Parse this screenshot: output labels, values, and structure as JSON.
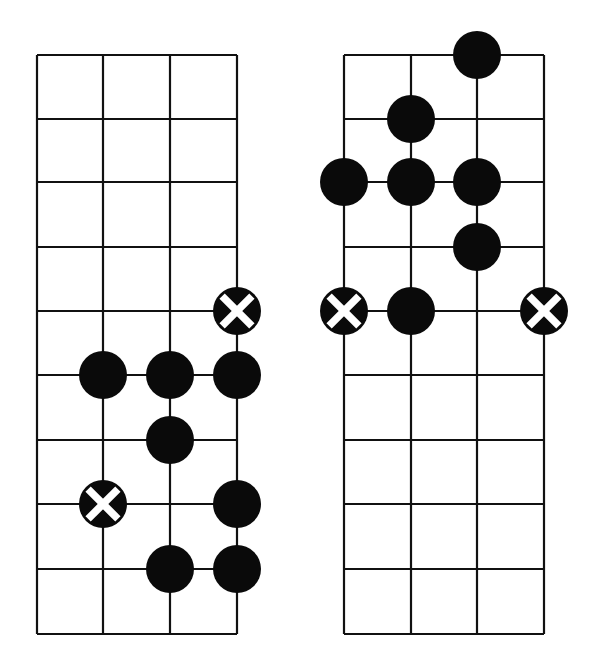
{
  "diagram": {
    "type": "fretboard-scale-patterns",
    "line_color": "#111111",
    "dot_color": "#0a0a0a",
    "x_color": "#ffffff",
    "background": "#ffffff",
    "dot_radius": 24,
    "row_lines_y": [
      55,
      119,
      182,
      247,
      311,
      375,
      440,
      504,
      569,
      634
    ],
    "grids": [
      {
        "id": "left",
        "columns_x": [
          37,
          103,
          170,
          237
        ],
        "markers": [
          {
            "col": 3,
            "row": 4,
            "kind": "root-x"
          },
          {
            "col": 1,
            "row": 5,
            "kind": "dot"
          },
          {
            "col": 2,
            "row": 5,
            "kind": "dot"
          },
          {
            "col": 3,
            "row": 5,
            "kind": "dot"
          },
          {
            "col": 2,
            "row": 6,
            "kind": "dot"
          },
          {
            "col": 1,
            "row": 7,
            "kind": "root-x"
          },
          {
            "col": 3,
            "row": 7,
            "kind": "dot"
          },
          {
            "col": 2,
            "row": 8,
            "kind": "dot"
          },
          {
            "col": 3,
            "row": 8,
            "kind": "dot"
          }
        ]
      },
      {
        "id": "right",
        "columns_x": [
          344,
          411,
          477,
          544
        ],
        "markers": [
          {
            "col": 2,
            "row": 0,
            "kind": "dot"
          },
          {
            "col": 1,
            "row": 1,
            "kind": "dot"
          },
          {
            "col": 0,
            "row": 2,
            "kind": "dot"
          },
          {
            "col": 1,
            "row": 2,
            "kind": "dot"
          },
          {
            "col": 2,
            "row": 2,
            "kind": "dot"
          },
          {
            "col": 2,
            "row": 3,
            "kind": "dot"
          },
          {
            "col": 0,
            "row": 4,
            "kind": "root-x"
          },
          {
            "col": 1,
            "row": 4,
            "kind": "dot"
          },
          {
            "col": 3,
            "row": 4,
            "kind": "root-x"
          }
        ]
      }
    ]
  }
}
